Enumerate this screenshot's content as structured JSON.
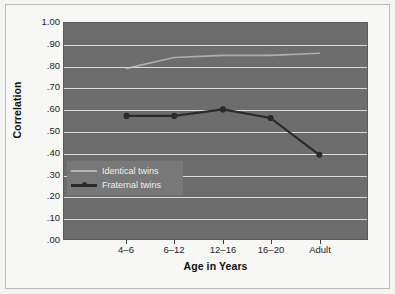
{
  "chart_data": {
    "type": "line",
    "title": "",
    "xlabel": "Age in Years",
    "ylabel": "Correlation",
    "categories": [
      "4–6",
      "6–12",
      "12–16",
      "16–20",
      "Adult"
    ],
    "ylim": [
      0.0,
      1.0
    ],
    "ytick_labels": [
      "1.00",
      ".90",
      ".80",
      ".70",
      ".60",
      ".50",
      ".40",
      ".30",
      ".20",
      ".10",
      ".00"
    ],
    "ytick_values": [
      1.0,
      0.9,
      0.8,
      0.7,
      0.6,
      0.5,
      0.4,
      0.3,
      0.2,
      0.1,
      0.0
    ],
    "grid": true,
    "legend_position": "lower-left-inside",
    "series": [
      {
        "name": "Identical twins",
        "values": [
          0.79,
          0.84,
          0.85,
          0.85,
          0.86
        ],
        "color": "#c9c9c4",
        "marker": "none"
      },
      {
        "name": "Fraternal twins",
        "values": [
          0.57,
          0.57,
          0.6,
          0.56,
          0.39
        ],
        "color": "#2b2b2b",
        "marker": "circle"
      }
    ]
  },
  "axes": {
    "y_title": "Correlation",
    "x_title": "Age in Years"
  },
  "legend": {
    "entries": [
      {
        "label": "Identical twins"
      },
      {
        "label": "Fraternal twins"
      }
    ]
  },
  "colors": {
    "plot_background": "#6d6d6d",
    "gridline": "#e9e9e6",
    "figure_background": "#f7f7f5",
    "frame_border": "#b9b9b5",
    "identical_series": "#c9c9c4",
    "fraternal_series": "#2b2b2b",
    "legend_background": "#787878",
    "tick_text": "#1d1d1d"
  }
}
